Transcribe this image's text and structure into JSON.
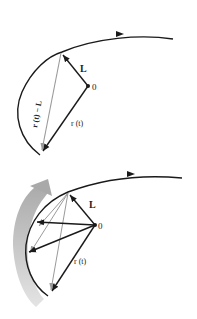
{
  "diagram_top": {
    "labels": {
      "L": "L",
      "origin": "0",
      "r": "r (t)",
      "r_minus_L": "r (t) − L"
    }
  },
  "diagram_bottom": {
    "labels": {
      "L": "L",
      "origin": "0",
      "r": "r (t)"
    }
  },
  "colors": {
    "curve": "#1a1a1a",
    "vector": "#1a1a1a",
    "difference_vector": "#9a9a9a",
    "motion_band": "#b8b8b8"
  }
}
